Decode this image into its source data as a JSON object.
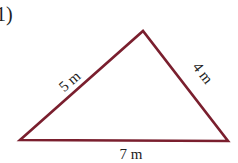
{
  "problem": {
    "label": "1)"
  },
  "triangle": {
    "stroke_color": "#7a1f2e",
    "vertices": {
      "left": [
        20,
        140
      ],
      "apex": [
        143,
        31
      ],
      "right": [
        228,
        141
      ]
    },
    "sides": {
      "left": {
        "label": "5 m",
        "length": 5
      },
      "right": {
        "label": "4 m",
        "length": 4
      },
      "base": {
        "label": "7 m",
        "length": 7
      }
    }
  }
}
